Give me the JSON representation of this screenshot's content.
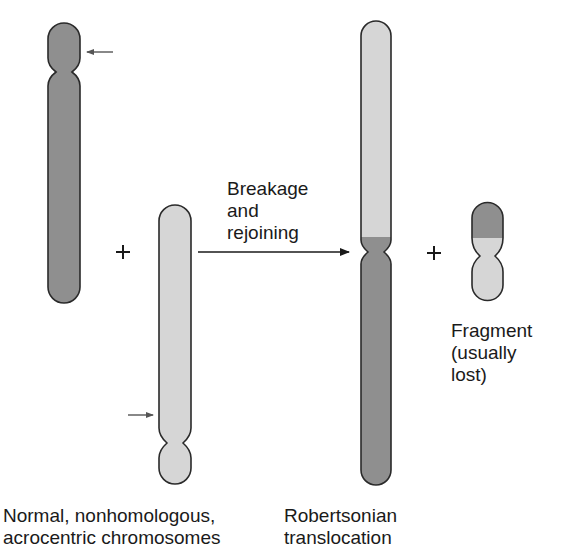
{
  "diagram": {
    "colors": {
      "dark_chromosome": "#8f8f8f",
      "light_chromosome": "#d6d6d6",
      "outline": "#2a2a2a",
      "arrow": "#555555",
      "text": "#1a1a1a"
    },
    "plus_signs": [
      "+",
      "+"
    ],
    "process_label": [
      "Breakage",
      "and",
      "rejoining"
    ],
    "fragment_label": [
      "Fragment",
      "(usually",
      "lost)"
    ],
    "left_caption": [
      "Normal, nonhomologous,",
      "acrocentric chromosomes"
    ],
    "right_caption": [
      "Robertsonian",
      "translocation"
    ],
    "chromosomes": [
      {
        "name": "acrocentric-chromosome-dark",
        "shade": "dark",
        "break_marker": "arrow at short arm"
      },
      {
        "name": "acrocentric-chromosome-light",
        "shade": "light",
        "break_marker": "arrow at long arm near centromere"
      },
      {
        "name": "robertsonian-chromosome",
        "shade": "light top / dark bottom"
      },
      {
        "name": "fragment-chromosome",
        "shade": "dark top / light bottom"
      }
    ]
  }
}
